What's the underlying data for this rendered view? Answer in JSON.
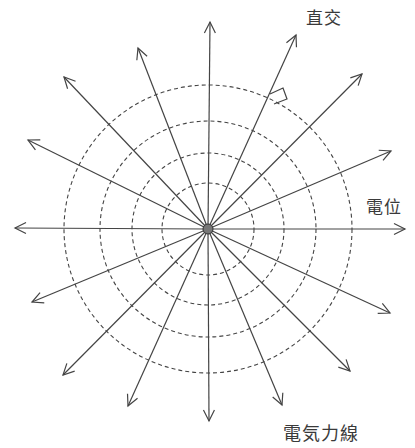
{
  "diagram": {
    "title": "",
    "labels": {
      "orthogonal": "直交",
      "potential": "電位",
      "field_lines": "電気力線"
    },
    "center": {
      "x": 208,
      "y": 229
    },
    "charge_radius": 5,
    "equipotential_radii": [
      46,
      76,
      108,
      144
    ],
    "field_line_tips": [
      {
        "x": 210,
        "y": 22
      },
      {
        "x": 296,
        "y": 35
      },
      {
        "x": 362,
        "y": 74
      },
      {
        "x": 391,
        "y": 151
      },
      {
        "x": 405,
        "y": 229
      },
      {
        "x": 390,
        "y": 313
      },
      {
        "x": 350,
        "y": 371
      },
      {
        "x": 282,
        "y": 405
      },
      {
        "x": 209,
        "y": 421
      },
      {
        "x": 128,
        "y": 406
      },
      {
        "x": 63,
        "y": 375
      },
      {
        "x": 32,
        "y": 302
      },
      {
        "x": 15,
        "y": 228
      },
      {
        "x": 28,
        "y": 140
      },
      {
        "x": 64,
        "y": 77
      },
      {
        "x": 138,
        "y": 48
      }
    ],
    "colors": {
      "line": "#444444",
      "dash": "#444444",
      "charge_fill": "#777777",
      "text": "#3a3a3a"
    }
  }
}
